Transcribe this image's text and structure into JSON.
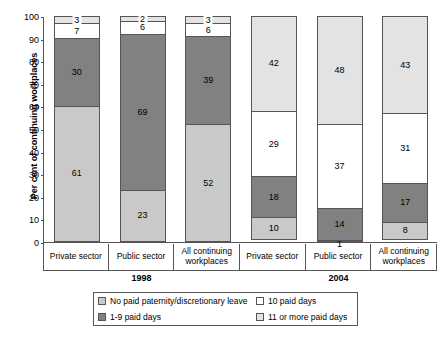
{
  "chart_data": {
    "type": "bar",
    "subtype": "stacked-bar-100",
    "title": "",
    "xlabel": "",
    "ylabel": "Per cent of continuing workplaces",
    "ylim": [
      0,
      100
    ],
    "yticks": [
      0,
      10,
      20,
      30,
      40,
      50,
      60,
      70,
      80,
      90,
      100
    ],
    "grid": false,
    "legend_position": "bottom",
    "categories": [
      "Private sector",
      "Public sector",
      "All continuing workplaces",
      "Private sector",
      "Public sector",
      "All continuing workplaces"
    ],
    "groups": [
      {
        "label": "1998",
        "categories": [
          "Private sector",
          "Public sector",
          "All continuing workplaces"
        ]
      },
      {
        "label": "2004",
        "categories": [
          "Private sector",
          "Public sector",
          "All continuing workplaces"
        ]
      }
    ],
    "series": [
      {
        "name": "No paid paternity/discretionary leave",
        "color": "#c9c9c9",
        "values": [
          61,
          23,
          52,
          10,
          1,
          8
        ]
      },
      {
        "name": "1-9 paid days",
        "color": "#818181",
        "values": [
          30,
          69,
          39,
          18,
          14,
          17
        ]
      },
      {
        "name": "10 paid days",
        "color": "#ffffff",
        "values": [
          7,
          6,
          6,
          29,
          37,
          31
        ]
      },
      {
        "name": "11 or more paid days",
        "color": "#e3e3e3",
        "values": [
          3,
          2,
          3,
          42,
          48,
          43
        ]
      }
    ],
    "bars": [
      {
        "group": "1998",
        "category": "Private sector",
        "segments": [
          {
            "series": "11 or more paid days",
            "value": 3,
            "label": "3",
            "label_position": "outside"
          },
          {
            "series": "10 paid days",
            "value": 7,
            "label": "7",
            "label_position": "inside"
          },
          {
            "series": "1-9 paid days",
            "value": 30,
            "label": "30",
            "label_position": "inside"
          },
          {
            "series": "No paid paternity/discretionary leave",
            "value": 61,
            "label": "61",
            "label_position": "inside"
          }
        ]
      },
      {
        "group": "1998",
        "category": "Public sector",
        "segments": [
          {
            "series": "11 or more paid days",
            "value": 2,
            "label": "2",
            "label_position": "outside"
          },
          {
            "series": "10 paid days",
            "value": 6,
            "label": "6",
            "label_position": "inside"
          },
          {
            "series": "1-9 paid days",
            "value": 69,
            "label": "69",
            "label_position": "inside"
          },
          {
            "series": "No paid paternity/discretionary leave",
            "value": 23,
            "label": "23",
            "label_position": "inside"
          }
        ]
      },
      {
        "group": "1998",
        "category": "All continuing workplaces",
        "segments": [
          {
            "series": "11 or more paid days",
            "value": 3,
            "label": "3",
            "label_position": "outside"
          },
          {
            "series": "10 paid days",
            "value": 6,
            "label": "6",
            "label_position": "inside"
          },
          {
            "series": "1-9 paid days",
            "value": 39,
            "label": "39",
            "label_position": "inside"
          },
          {
            "series": "No paid paternity/discretionary leave",
            "value": 52,
            "label": "52",
            "label_position": "inside"
          }
        ]
      },
      {
        "group": "2004",
        "category": "Private sector",
        "segments": [
          {
            "series": "11 or more paid days",
            "value": 42,
            "label": "42",
            "label_position": "inside"
          },
          {
            "series": "10 paid days",
            "value": 29,
            "label": "29",
            "label_position": "inside"
          },
          {
            "series": "1-9 paid days",
            "value": 18,
            "label": "18",
            "label_position": "inside"
          },
          {
            "series": "No paid paternity/discretionary leave",
            "value": 10,
            "label": "10",
            "label_position": "inside"
          }
        ]
      },
      {
        "group": "2004",
        "category": "Public sector",
        "segments": [
          {
            "series": "11 or more paid days",
            "value": 48,
            "label": "48",
            "label_position": "inside"
          },
          {
            "series": "10 paid days",
            "value": 37,
            "label": "37",
            "label_position": "inside"
          },
          {
            "series": "1-9 paid days",
            "value": 14,
            "label": "14",
            "label_position": "inside"
          },
          {
            "series": "No paid paternity/discretionary leave",
            "value": 1,
            "label": "1",
            "label_position": "below"
          }
        ]
      },
      {
        "group": "2004",
        "category": "All continuing workplaces",
        "segments": [
          {
            "series": "11 or more paid days",
            "value": 43,
            "label": "43",
            "label_position": "inside"
          },
          {
            "series": "10 paid days",
            "value": 31,
            "label": "31",
            "label_position": "inside"
          },
          {
            "series": "1-9 paid days",
            "value": 17,
            "label": "17",
            "label_position": "inside"
          },
          {
            "series": "No paid paternity/discretionary leave",
            "value": 8,
            "label": "8",
            "label_position": "inside"
          }
        ]
      }
    ],
    "legend": [
      {
        "label": "No paid paternity/discretionary leave",
        "color": "#c9c9c9",
        "swatch": "c-none"
      },
      {
        "label": "10 paid days",
        "color": "#ffffff",
        "swatch": "c-ten"
      },
      {
        "label": "1-9 paid days",
        "color": "#818181",
        "swatch": "c-1to9"
      },
      {
        "label": "11 or more paid days",
        "color": "#e3e3e3",
        "swatch": "c-eleven"
      }
    ]
  }
}
